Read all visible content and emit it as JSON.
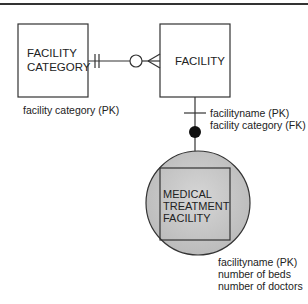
{
  "diagram": {
    "type": "entity-relationship",
    "entities": [
      {
        "id": "facility_category",
        "name_lines": [
          "FACILITY",
          "CATEGORY"
        ],
        "attributes": [
          "facility category (PK)"
        ]
      },
      {
        "id": "facility",
        "name_lines": [
          "FACILITY"
        ],
        "attributes": [
          "facilityname (PK)",
          "facility category (FK)"
        ]
      },
      {
        "id": "medical_treatment_facility",
        "name_lines": [
          "MEDICAL",
          "TREATMENT",
          "FACILITY"
        ],
        "attributes": [
          "facilityname (PK)",
          "number of beds",
          "number of doctors"
        ],
        "subtype": true
      }
    ],
    "relationships": [
      {
        "from": "facility_category",
        "to": "facility",
        "from_cardinality": "one-and-only-one",
        "to_cardinality": "zero-or-many"
      },
      {
        "from": "facility",
        "to": "medical_treatment_facility",
        "kind": "subtype",
        "from_marker": "one bar",
        "to_marker": "filled circle"
      }
    ],
    "colors": {
      "line": "#333333",
      "circle_fill": "#c8c8c8",
      "dot": "#111111"
    }
  }
}
